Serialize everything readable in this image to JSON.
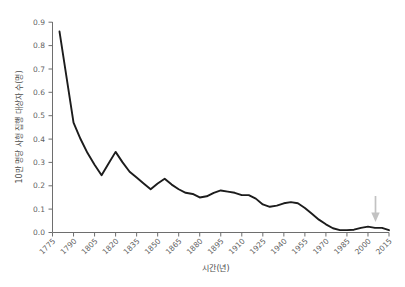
{
  "chart_data": {
    "type": "line",
    "title": "",
    "xlabel": "시간(년)",
    "ylabel": "10만 명당 사형 집행 대상자 수(명)",
    "xlim": [
      1775,
      2015
    ],
    "ylim": [
      0.0,
      0.9
    ],
    "grid": false,
    "legend": "none",
    "xtick_labels": [
      "1775",
      "1790",
      "1805",
      "1820",
      "1835",
      "1850",
      "1865",
      "1880",
      "1895",
      "1910",
      "1925",
      "1940",
      "1955",
      "1970",
      "1985",
      "2000",
      "2015"
    ],
    "ytick_labels": [
      "0.0",
      "0.1",
      "0.2",
      "0.3",
      "0.4",
      "0.5",
      "0.6",
      "0.7",
      "0.8",
      "0.9"
    ],
    "x": [
      1780,
      1790,
      1795,
      1800,
      1805,
      1810,
      1815,
      1820,
      1825,
      1830,
      1835,
      1840,
      1845,
      1850,
      1855,
      1860,
      1865,
      1870,
      1875,
      1880,
      1885,
      1890,
      1895,
      1900,
      1905,
      1910,
      1915,
      1920,
      1925,
      1930,
      1935,
      1940,
      1945,
      1950,
      1955,
      1960,
      1965,
      1970,
      1975,
      1980,
      1985,
      1990,
      1995,
      2000,
      2005,
      2010,
      2015
    ],
    "values": [
      0.86,
      0.47,
      0.4,
      0.34,
      0.29,
      0.245,
      0.295,
      0.345,
      0.3,
      0.26,
      0.235,
      0.21,
      0.185,
      0.21,
      0.23,
      0.205,
      0.185,
      0.17,
      0.165,
      0.15,
      0.155,
      0.17,
      0.18,
      0.175,
      0.17,
      0.16,
      0.16,
      0.145,
      0.12,
      0.11,
      0.115,
      0.125,
      0.13,
      0.125,
      0.105,
      0.08,
      0.055,
      0.035,
      0.018,
      0.01,
      0.01,
      0.012,
      0.02,
      0.025,
      0.02,
      0.02,
      0.01
    ],
    "annotations": [
      {
        "name": "arrow-marker",
        "kind": "down-arrow",
        "x": 2010,
        "color": "#c2c2c2"
      }
    ],
    "line_color": "#1c1c1c",
    "axis_color": "#6e6e6e",
    "background_color": "#ffffff"
  }
}
